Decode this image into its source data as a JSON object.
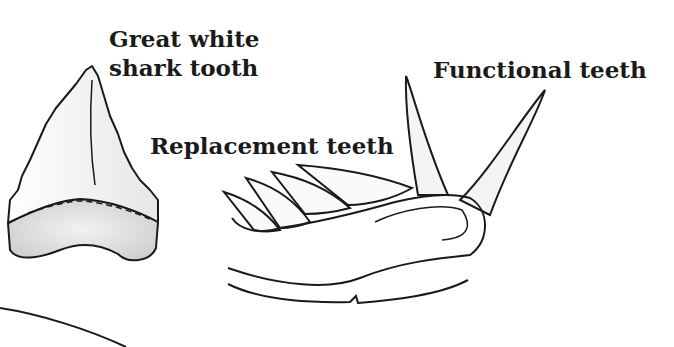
{
  "diagram": {
    "labels": {
      "great_white_line1": "Great white",
      "great_white_line2": "shark tooth",
      "replacement": "Replacement teeth",
      "functional": "Functional teeth"
    },
    "colors": {
      "ink": "#1a1a1a",
      "shade": "#e4e4e4",
      "background": "#ffffff"
    }
  }
}
